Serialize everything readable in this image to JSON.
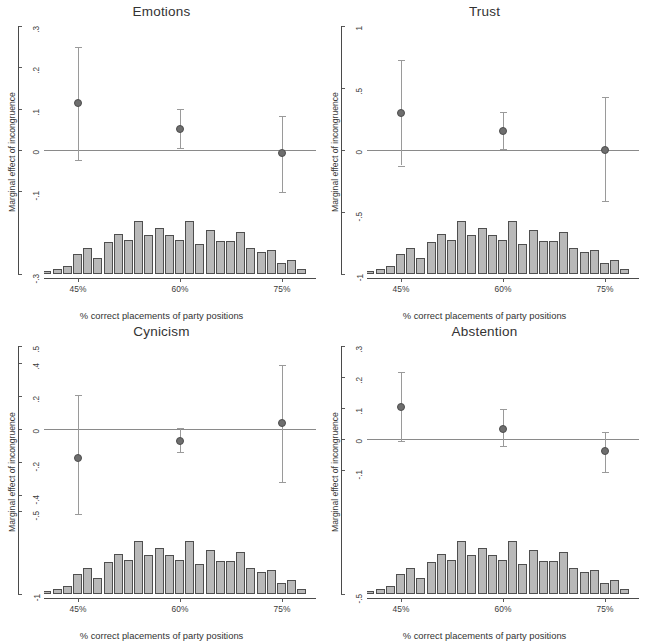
{
  "figure": {
    "xlabel": "% correct placements of party positions",
    "ylabel": "Marginal effect of incongruence",
    "xtick_labels": [
      "45%",
      "60%",
      "75%"
    ],
    "xtick_values": [
      45,
      60,
      75
    ],
    "xlim": [
      40,
      80
    ],
    "point_color": "#6e6e6e",
    "ci_color": "#9a9a9a",
    "bar_color": "#b9b9b9",
    "bar_edge_color": "#4f4f4f",
    "zero_line_color": "#8a8a8a"
  },
  "chart_data": [
    {
      "type": "scatter",
      "title": "Emotions",
      "xlabel": "% correct placements of party positions",
      "ylabel": "Marginal effect of incongruence",
      "xlim": [
        40,
        80
      ],
      "ylim": [
        -0.3,
        0.3
      ],
      "ytick_labels": [
        ".3",
        ".2",
        ".1",
        "0",
        "-.1",
        "-.3"
      ],
      "ytick_values": [
        0.3,
        0.2,
        0.1,
        0,
        -0.1,
        -0.3
      ],
      "xtick_labels": [
        "45%",
        "60%",
        "75%"
      ],
      "x": [
        45,
        60,
        75
      ],
      "values": [
        0.113,
        0.052,
        -0.008
      ],
      "ci_low": [
        -0.025,
        0.005,
        -0.101
      ],
      "ci_high": [
        0.249,
        0.098,
        0.082
      ],
      "grid": false,
      "zero_reference_line": 0,
      "histogram": {
        "type": "bar",
        "note": "distribution of % correct placements overlaid at panel bottom",
        "bin_centers": [
          40.5,
          42.0,
          43.5,
          45.0,
          46.5,
          48.0,
          49.5,
          51.0,
          52.5,
          54.0,
          55.5,
          57.0,
          58.5,
          60.0,
          61.5,
          63.0,
          64.5,
          66.0,
          67.5,
          69.0,
          70.5,
          72.0,
          73.5,
          75.0,
          76.5,
          78.0
        ],
        "values": [
          0.3,
          0.5,
          0.8,
          2.0,
          2.6,
          1.6,
          3.2,
          4.0,
          3.4,
          5.3,
          3.9,
          4.6,
          3.9,
          3.4,
          5.3,
          3.0,
          4.4,
          3.3,
          3.3,
          4.2,
          2.6,
          2.2,
          2.4,
          1.1,
          1.4,
          0.5
        ]
      }
    },
    {
      "type": "scatter",
      "title": "Trust",
      "xlabel": "% correct placements of party positions",
      "ylabel": "Marginal effect of incongruence",
      "xlim": [
        40,
        80
      ],
      "ylim": [
        -1.0,
        1.0
      ],
      "ytick_labels": [
        "1",
        ".5",
        "0",
        "-.5",
        "-1"
      ],
      "ytick_values": [
        1,
        0.5,
        0,
        -0.5,
        -1
      ],
      "xtick_labels": [
        "45%",
        "60%",
        "75%"
      ],
      "x": [
        45,
        60,
        75
      ],
      "values": [
        0.3,
        0.155,
        0.003
      ],
      "ci_low": [
        -0.125,
        0.005,
        -0.415
      ],
      "ci_high": [
        0.725,
        0.305,
        0.425
      ],
      "grid": false,
      "zero_reference_line": 0,
      "histogram": {
        "type": "bar",
        "note": "distribution of % correct placements overlaid at panel bottom",
        "bin_centers": [
          40.5,
          42.0,
          43.5,
          45.0,
          46.5,
          48.0,
          49.5,
          51.0,
          52.5,
          54.0,
          55.5,
          57.0,
          58.5,
          60.0,
          61.5,
          63.0,
          64.5,
          66.0,
          67.5,
          69.0,
          70.5,
          72.0,
          73.5,
          75.0,
          76.5,
          78.0
        ],
        "values": [
          0.3,
          0.5,
          0.8,
          2.0,
          2.6,
          1.6,
          3.2,
          4.0,
          3.4,
          5.3,
          3.9,
          4.6,
          3.9,
          3.4,
          5.3,
          3.0,
          4.4,
          3.3,
          3.3,
          4.2,
          2.6,
          2.2,
          2.4,
          1.1,
          1.4,
          0.5
        ]
      }
    },
    {
      "type": "scatter",
      "title": "Cynicism",
      "xlabel": "% correct placements of party positions",
      "ylabel": "Marginal effect of incongruence",
      "xlim": [
        40,
        80
      ],
      "ylim": [
        -1.0,
        0.5
      ],
      "ytick_labels": [
        ".5",
        ".4",
        ".2",
        "0",
        "-.2",
        "-.4",
        "-.5",
        "-1"
      ],
      "ytick_values": [
        0.5,
        0.4,
        0.2,
        0,
        -0.2,
        -0.4,
        -0.5,
        -1
      ],
      "xtick_labels": [
        "45%",
        "60%",
        "75%"
      ],
      "x": [
        45,
        60,
        75
      ],
      "values": [
        -0.175,
        -0.072,
        0.032
      ],
      "ci_low": [
        -0.515,
        -0.142,
        -0.325
      ],
      "ci_high": [
        0.205,
        0.002,
        0.385
      ],
      "grid": false,
      "zero_reference_line": 0,
      "histogram": {
        "type": "bar",
        "note": "distribution of % correct placements overlaid at panel bottom",
        "bin_centers": [
          40.5,
          42.0,
          43.5,
          45.0,
          46.5,
          48.0,
          49.5,
          51.0,
          52.5,
          54.0,
          55.5,
          57.0,
          58.5,
          60.0,
          61.5,
          63.0,
          64.5,
          66.0,
          67.5,
          69.0,
          70.5,
          72.0,
          73.5,
          75.0,
          76.5,
          78.0
        ],
        "values": [
          0.3,
          0.5,
          0.8,
          2.0,
          2.6,
          1.6,
          3.2,
          4.0,
          3.4,
          5.3,
          3.9,
          4.6,
          3.9,
          3.4,
          5.3,
          3.0,
          4.4,
          3.3,
          3.3,
          4.2,
          2.6,
          2.2,
          2.4,
          1.1,
          1.4,
          0.5
        ]
      }
    },
    {
      "type": "scatter",
      "title": "Abstention",
      "xlabel": "% correct placements of party positions",
      "ylabel": "Marginal effect of incongruence",
      "xlim": [
        40,
        80
      ],
      "ylim": [
        -0.5,
        0.3
      ],
      "ytick_labels": [
        ".3",
        ".2",
        ".1",
        "0",
        "-.1",
        "-.5"
      ],
      "ytick_values": [
        0.3,
        0.2,
        0.1,
        0,
        -0.1,
        -0.5
      ],
      "xtick_labels": [
        "45%",
        "60%",
        "75%"
      ],
      "x": [
        45,
        60,
        75
      ],
      "values": [
        0.102,
        0.032,
        -0.038
      ],
      "ci_low": [
        -0.007,
        -0.022,
        -0.105
      ],
      "ci_high": [
        0.215,
        0.098,
        0.022
      ],
      "grid": false,
      "zero_reference_line": 0,
      "histogram": {
        "type": "bar",
        "note": "distribution of % correct placements overlaid at panel bottom",
        "bin_centers": [
          40.5,
          42.0,
          43.5,
          45.0,
          46.5,
          48.0,
          49.5,
          51.0,
          52.5,
          54.0,
          55.5,
          57.0,
          58.5,
          60.0,
          61.5,
          63.0,
          64.5,
          66.0,
          67.5,
          69.0,
          70.5,
          72.0,
          73.5,
          75.0,
          76.5,
          78.0
        ],
        "values": [
          0.3,
          0.5,
          0.8,
          2.0,
          2.6,
          1.6,
          3.2,
          4.0,
          3.4,
          5.3,
          3.9,
          4.6,
          3.9,
          3.4,
          5.3,
          3.0,
          4.4,
          3.3,
          3.3,
          4.2,
          2.6,
          2.2,
          2.4,
          1.1,
          1.4,
          0.5
        ]
      }
    }
  ]
}
